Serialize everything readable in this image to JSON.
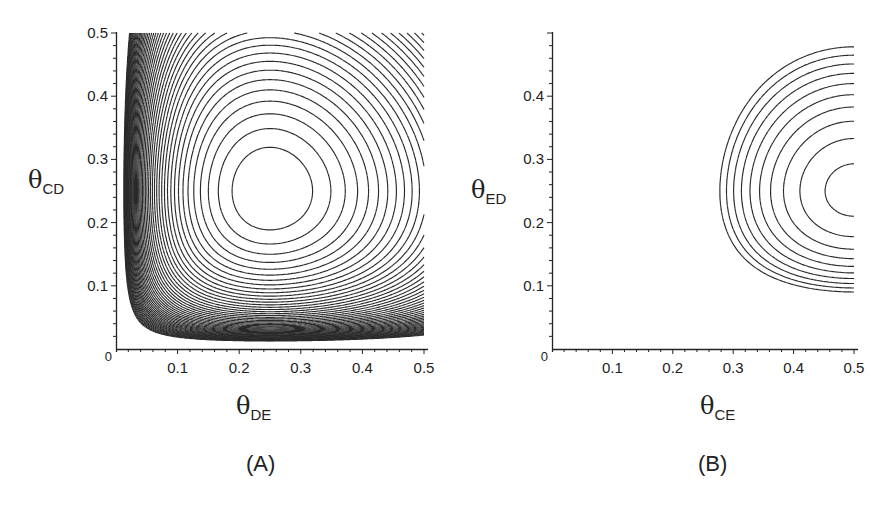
{
  "chart_data": [
    {
      "type": "contour",
      "panel_label": "(A)",
      "xlabel": "θ",
      "xlabel_sub": "DE",
      "ylabel": "θ",
      "ylabel_sub": "CD",
      "xlim": [
        0,
        0.5
      ],
      "ylim": [
        0,
        0.5
      ],
      "xticks": [
        "0.1",
        "0.2",
        "0.3",
        "0.4",
        "0.5"
      ],
      "xtick_values": [
        0.1,
        0.2,
        0.3,
        0.4,
        0.5
      ],
      "yticks": [
        "0.1",
        "0.2",
        "0.3",
        "0.4",
        "0.5"
      ],
      "ytick_values": [
        0.1,
        0.2,
        0.3,
        0.4,
        0.5
      ],
      "origin_label": "0",
      "grid": false,
      "surface": "log-likelihood peaked at (0.25, 0.25); contours crowd toward low θ edges",
      "peak": {
        "x": 0.25,
        "y": 0.25
      },
      "fx": {
        "p": 0.25
      },
      "fy": {
        "p": 0.25
      },
      "level_step": 0.0112,
      "level_offset": 0.0115,
      "num_levels": 48,
      "innermost_contour_extent": {
        "x": [
          0.195,
          0.32
        ],
        "y": [
          0.19,
          0.32
        ]
      },
      "lowest_contour_min_y": 0.05,
      "leftmost_contour_min_x": 0.045,
      "pixel_frame": {
        "x0": 116,
        "y0": 349,
        "x1": 424,
        "y1": 33
      }
    },
    {
      "type": "contour",
      "panel_label": "(B)",
      "xlabel": "θ",
      "xlabel_sub": "CE",
      "ylabel": "θ",
      "ylabel_sub": "ED",
      "xlim": [
        0,
        0.5
      ],
      "ylim": [
        0,
        0.5
      ],
      "xticks": [
        "0.1",
        "0.2",
        "0.3",
        "0.4",
        "0.5"
      ],
      "xtick_values": [
        0.1,
        0.2,
        0.3,
        0.4,
        0.5
      ],
      "yticks": [
        "0.1",
        "0.2",
        "0.3",
        "0.4"
      ],
      "ytick_values": [
        0.1,
        0.2,
        0.3,
        0.4
      ],
      "origin_label": "0",
      "grid": false,
      "surface": "log-likelihood peaked at (0.5, 0.25); only half-contours visible up to θ_CE = 0.5",
      "peak": {
        "x": 0.5,
        "y": 0.25
      },
      "fx": {
        "p": 0.5
      },
      "fy": {
        "p": 0.25
      },
      "level_step": 0.0117,
      "level_offset": 0.0046,
      "num_levels": 10,
      "innermost_contour_extent": {
        "x": [
          0.452,
          0.5
        ],
        "y": [
          0.21,
          0.3
        ]
      },
      "outermost_contour_extent": {
        "x": [
          0.275,
          0.5
        ],
        "y": [
          0.09,
          0.49
        ]
      },
      "pixel_frame": {
        "x0": 105,
        "y0": 349,
        "x1": 407,
        "y1": 33
      }
    }
  ]
}
